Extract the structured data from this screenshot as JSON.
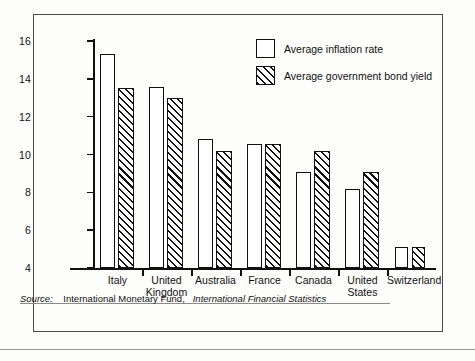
{
  "chart_data": {
    "type": "bar",
    "title": "",
    "xlabel": "",
    "ylabel": "",
    "ylim": [
      4,
      16
    ],
    "yticks": [
      4,
      6,
      8,
      10,
      12,
      14,
      16
    ],
    "grid": false,
    "legend_position": "top-right",
    "categories": [
      "Italy",
      "United\nKingdom",
      "Australia",
      "France",
      "Canada",
      "United\nStates",
      "Switzerland"
    ],
    "series": [
      {
        "name": "Average inflation rate",
        "style": "open",
        "values": [
          15.3,
          13.55,
          10.8,
          10.55,
          9.1,
          8.2,
          5.1
        ]
      },
      {
        "name": "Average government bond yield",
        "style": "hatched",
        "values": [
          13.5,
          13.0,
          10.2,
          10.55,
          10.2,
          9.1,
          5.1
        ]
      }
    ]
  },
  "legend": {
    "items": [
      {
        "label": "Average inflation rate",
        "style": "open"
      },
      {
        "label": "Average government bond yield",
        "style": "hatched"
      }
    ]
  },
  "source": {
    "label": "Source:",
    "body": "International Monetary Fund,",
    "publication": "International Financial Statistics"
  },
  "colors": {
    "ink": "#111111",
    "frame": "#4a4a4a",
    "background": "#fdfdfb",
    "rule": "#8c8c8c"
  }
}
